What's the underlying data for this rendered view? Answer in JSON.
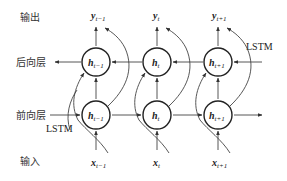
{
  "labels": {
    "output_row": "输出",
    "backward_layer": "后向层",
    "forward_layer": "前向层",
    "input_row": "输入",
    "lstm_top": "LSTM",
    "lstm_bottom": "LSTM"
  },
  "columns": [
    {
      "output": "y",
      "output_sub": "t−1",
      "backward": "h",
      "backward_sub": "t−1",
      "forward": "h",
      "forward_sub": "t−1",
      "input": "x",
      "input_sub": "t−1"
    },
    {
      "output": "y",
      "output_sub": "t",
      "backward": "h",
      "backward_sub": "t",
      "forward": "h",
      "forward_sub": "t",
      "input": "x",
      "input_sub": "t"
    },
    {
      "output": "y",
      "output_sub": "t+1",
      "backward": "h",
      "backward_sub": "t+1",
      "forward": "h",
      "forward_sub": "t+1",
      "input": "x",
      "input_sub": "t+1"
    }
  ],
  "colors": {
    "line": "#444444",
    "circle": "#222222",
    "text": "#333333"
  }
}
